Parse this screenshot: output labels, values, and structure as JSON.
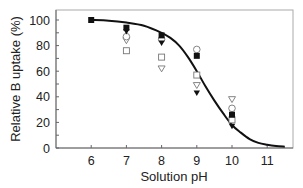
{
  "chart_data": {
    "type": "scatter",
    "title": "",
    "xlabel": "Solution pH",
    "ylabel": "Relative B uptake (%)",
    "xlim": [
      5,
      11.75
    ],
    "ylim": [
      0,
      105
    ],
    "x_ticks": [
      6,
      7,
      8,
      9,
      10,
      11
    ],
    "y_ticks": [
      0,
      20,
      40,
      60,
      80,
      100
    ],
    "grid": false,
    "legend": null,
    "series": [
      {
        "name": "filled-square",
        "marker": "square-filled",
        "x": [
          6,
          7,
          8,
          9,
          10
        ],
        "y": [
          100,
          94,
          88,
          72,
          26
        ]
      },
      {
        "name": "filled-triangle",
        "marker": "triangle-down-filled",
        "x": [
          7,
          8,
          9,
          10
        ],
        "y": [
          91,
          82,
          43,
          17
        ]
      },
      {
        "name": "open-circle",
        "marker": "circle-open",
        "x": [
          7,
          8,
          9,
          10
        ],
        "y": [
          87,
          85,
          77,
          31
        ]
      },
      {
        "name": "open-triangle",
        "marker": "triangle-down-open",
        "x": [
          7,
          8,
          9,
          10
        ],
        "y": [
          84,
          62,
          49,
          38
        ]
      },
      {
        "name": "open-square",
        "marker": "square-open",
        "x": [
          7,
          8,
          9,
          10
        ],
        "y": [
          76,
          71,
          57,
          22
        ]
      }
    ],
    "fit_curve": {
      "name": "model-fit",
      "style": "solid-black",
      "x": [
        6,
        6.5,
        7,
        7.5,
        8,
        8.25,
        8.5,
        8.75,
        9,
        9.25,
        9.5,
        9.75,
        10,
        10.25,
        10.5,
        10.75,
        11,
        11.25,
        11.5
      ],
      "y": [
        100,
        99.5,
        98,
        95.5,
        90,
        86,
        80,
        71,
        60,
        48,
        37,
        27,
        18,
        12,
        7,
        4,
        2.5,
        1.5,
        1
      ]
    }
  }
}
